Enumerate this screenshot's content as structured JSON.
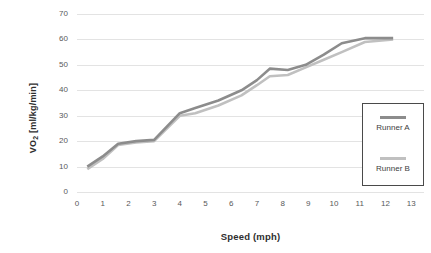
{
  "chart_data": {
    "type": "line",
    "title": "",
    "title_cropped": true,
    "xlabel": "Speed (mph)",
    "ylabel": "VO2 [ml/kg/min]",
    "ylabel_html": "VO<sub>2</sub> [ml/kg/min]",
    "xlim": [
      0,
      13.5
    ],
    "ylim": [
      0,
      70
    ],
    "xticks": [
      0,
      1,
      2,
      3,
      4,
      5,
      6,
      7,
      8,
      9,
      10,
      11,
      12,
      13
    ],
    "yticks": [
      0,
      10,
      20,
      30,
      40,
      50,
      60,
      70
    ],
    "grid": "horizontal",
    "legend_position": "right-inside",
    "series": [
      {
        "name": "Runner A",
        "color": "#8c8c8c",
        "x": [
          0.4,
          1.0,
          1.6,
          2.3,
          3.0,
          4.0,
          4.6,
          5.5,
          6.4,
          7.0,
          7.5,
          8.2,
          8.9,
          9.6,
          10.3,
          11.2,
          12.3
        ],
        "y": [
          10,
          14,
          19,
          20,
          20.5,
          31,
          33,
          36,
          40,
          44,
          48.5,
          48,
          50,
          54,
          58.5,
          60.5,
          60.5
        ]
      },
      {
        "name": "Runner B",
        "color": "#c0c0c0",
        "x": [
          0.4,
          1.0,
          1.6,
          2.3,
          3.0,
          4.0,
          4.6,
          5.5,
          6.4,
          7.0,
          7.5,
          8.2,
          8.9,
          9.6,
          10.3,
          11.2,
          12.3
        ],
        "y": [
          9,
          13,
          18.5,
          19.5,
          20,
          30,
          31,
          34,
          38,
          42,
          45.5,
          46,
          49,
          52,
          55,
          59,
          60
        ]
      }
    ]
  },
  "legend": {
    "entries": [
      {
        "label": "Runner A",
        "color": "#8c8c8c"
      },
      {
        "label": "Runner B",
        "color": "#c0c0c0"
      }
    ]
  },
  "axes": {
    "x_title": "Speed (mph)",
    "y_title_main": "VO",
    "y_title_sub": "2",
    "y_title_unit": " [ml/kg/min]"
  }
}
